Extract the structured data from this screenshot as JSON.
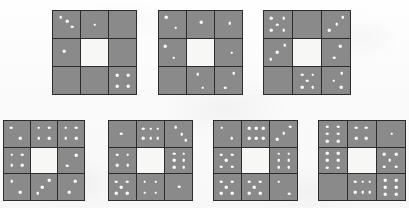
{
  "figure": {
    "title": "",
    "background_color": "#fcfcfc",
    "cell_color": "#8a8a8a",
    "center_cell_color": "#f7f7f5",
    "grid_line_color": "#2c2c2c",
    "dot_color": "#fdfdfd",
    "rows": [
      {
        "name": "top-row",
        "count": 3
      },
      {
        "name": "bottom-row",
        "count": 4
      }
    ]
  },
  "matrices": [
    {
      "id": "matrix-1",
      "row": "top-row",
      "index": 1,
      "x": 52,
      "y": 10,
      "width": 85,
      "height": 85,
      "cells": [
        {
          "name": "top-left",
          "dot_count": 3,
          "dots": [
            [
              28,
              22
            ],
            [
              52,
              38
            ],
            [
              72,
              58
            ]
          ]
        },
        {
          "name": "top-middle",
          "dot_count": 1,
          "dots": [
            [
              50,
              50
            ]
          ]
        },
        {
          "name": "top-right",
          "dot_count": 0,
          "dots": []
        },
        {
          "name": "middle-left",
          "dot_count": 1,
          "dots": [
            [
              42,
              46
            ]
          ]
        },
        {
          "name": "center",
          "dot_count": 0,
          "dots": [],
          "empty": true
        },
        {
          "name": "middle-right",
          "dot_count": 0,
          "dots": []
        },
        {
          "name": "bottom-left",
          "dot_count": 0,
          "dots": []
        },
        {
          "name": "bottom-middle",
          "dot_count": 0,
          "dots": []
        },
        {
          "name": "bottom-right",
          "dot_count": 4,
          "dots": [
            [
              30,
              30
            ],
            [
              72,
              30
            ],
            [
              30,
              72
            ],
            [
              72,
              72
            ]
          ]
        }
      ]
    },
    {
      "id": "matrix-2",
      "row": "top-row",
      "index": 2,
      "x": 158,
      "y": 10,
      "width": 85,
      "height": 85,
      "cells": [
        {
          "name": "top-left",
          "dot_count": 2,
          "dots": [
            [
              26,
              24
            ],
            [
              62,
              62
            ]
          ]
        },
        {
          "name": "top-middle",
          "dot_count": 1,
          "dots": [
            [
              52,
              42
            ]
          ]
        },
        {
          "name": "top-right",
          "dot_count": 1,
          "dots": [
            [
              54,
              46
            ]
          ]
        },
        {
          "name": "middle-left",
          "dot_count": 2,
          "dots": [
            [
              24,
              26
            ],
            [
              54,
              70
            ]
          ]
        },
        {
          "name": "center",
          "dot_count": 0,
          "dots": [],
          "empty": true
        },
        {
          "name": "middle-right",
          "dot_count": 1,
          "dots": [
            [
              62,
              50
            ]
          ]
        },
        {
          "name": "bottom-left",
          "dot_count": 0,
          "dots": []
        },
        {
          "name": "bottom-middle",
          "dot_count": 2,
          "dots": [
            [
              40,
              26
            ],
            [
              58,
              76
            ]
          ]
        },
        {
          "name": "bottom-right",
          "dot_count": 2,
          "dots": [
            [
              70,
              22
            ],
            [
              38,
              76
            ]
          ]
        }
      ]
    },
    {
      "id": "matrix-3",
      "row": "top-row",
      "index": 3,
      "x": 263,
      "y": 10,
      "width": 88,
      "height": 85,
      "cells": [
        {
          "name": "top-left",
          "dot_count": 5,
          "dots": [
            [
              26,
              26
            ],
            [
              70,
              26
            ],
            [
              48,
              50
            ],
            [
              26,
              72
            ],
            [
              70,
              72
            ]
          ]
        },
        {
          "name": "top-middle",
          "dot_count": 0,
          "dots": []
        },
        {
          "name": "top-right",
          "dot_count": 3,
          "dots": [
            [
              74,
              22
            ],
            [
              52,
              48
            ],
            [
              26,
              72
            ]
          ]
        },
        {
          "name": "middle-left",
          "dot_count": 3,
          "dots": [
            [
              74,
              22
            ],
            [
              48,
              48
            ],
            [
              24,
              74
            ]
          ]
        },
        {
          "name": "center",
          "dot_count": 0,
          "dots": [],
          "empty": true
        },
        {
          "name": "middle-right",
          "dot_count": 2,
          "dots": [
            [
              66,
              26
            ],
            [
              44,
              70
            ]
          ]
        },
        {
          "name": "bottom-left",
          "dot_count": 0,
          "dots": []
        },
        {
          "name": "bottom-middle",
          "dot_count": 5,
          "dots": [
            [
              32,
              28
            ],
            [
              70,
              28
            ],
            [
              50,
              50
            ],
            [
              32,
              74
            ],
            [
              70,
              74
            ]
          ]
        },
        {
          "name": "bottom-right",
          "dot_count": 3,
          "dots": [
            [
              70,
              24
            ],
            [
              42,
              50
            ],
            [
              68,
              74
            ]
          ]
        }
      ]
    },
    {
      "id": "matrix-4",
      "row": "bottom-row",
      "index": 4,
      "x": 3,
      "y": 120,
      "width": 82,
      "height": 81,
      "cells": [
        {
          "name": "top-left",
          "dot_count": 2,
          "dots": [
            [
              28,
              26
            ],
            [
              62,
              66
            ]
          ]
        },
        {
          "name": "top-middle",
          "dot_count": 4,
          "dots": [
            [
              30,
              26
            ],
            [
              70,
              26
            ],
            [
              30,
              66
            ],
            [
              70,
              66
            ]
          ]
        },
        {
          "name": "top-right",
          "dot_count": 4,
          "dots": [
            [
              30,
              26
            ],
            [
              70,
              26
            ],
            [
              30,
              66
            ],
            [
              70,
              66
            ]
          ]
        },
        {
          "name": "middle-left",
          "dot_count": 4,
          "dots": [
            [
              30,
              28
            ],
            [
              70,
              28
            ],
            [
              30,
              68
            ],
            [
              70,
              68
            ]
          ]
        },
        {
          "name": "center",
          "dot_count": 0,
          "dots": [],
          "empty": true
        },
        {
          "name": "middle-right",
          "dot_count": 2,
          "dots": [
            [
              70,
              30
            ],
            [
              36,
              70
            ]
          ]
        },
        {
          "name": "bottom-left",
          "dot_count": 2,
          "dots": [
            [
              30,
              26
            ],
            [
              62,
              70
            ]
          ]
        },
        {
          "name": "bottom-middle",
          "dot_count": 3,
          "dots": [
            [
              70,
              24
            ],
            [
              44,
              50
            ],
            [
              26,
              74
            ]
          ]
        },
        {
          "name": "bottom-right",
          "dot_count": 2,
          "dots": [
            [
              66,
              26
            ],
            [
              44,
              70
            ]
          ]
        }
      ]
    },
    {
      "id": "matrix-5",
      "row": "bottom-row",
      "index": 5,
      "x": 108,
      "y": 120,
      "width": 85,
      "height": 81,
      "cells": [
        {
          "name": "top-left",
          "dot_count": 1,
          "dots": [
            [
              46,
              50
            ]
          ]
        },
        {
          "name": "top-middle",
          "dot_count": 6,
          "dots": [
            [
              24,
              30
            ],
            [
              50,
              30
            ],
            [
              76,
              30
            ],
            [
              24,
              68
            ],
            [
              50,
              68
            ],
            [
              76,
              68
            ]
          ]
        },
        {
          "name": "top-right",
          "dot_count": 3,
          "dots": [
            [
              40,
              24
            ],
            [
              62,
              52
            ],
            [
              76,
              76
            ]
          ]
        },
        {
          "name": "middle-left",
          "dot_count": 4,
          "dots": [
            [
              30,
              28
            ],
            [
              70,
              28
            ],
            [
              30,
              68
            ],
            [
              70,
              68
            ]
          ]
        },
        {
          "name": "center",
          "dot_count": 0,
          "dots": [],
          "empty": true
        },
        {
          "name": "middle-right",
          "dot_count": 6,
          "dots": [
            [
              34,
              24
            ],
            [
              70,
              24
            ],
            [
              34,
              50
            ],
            [
              70,
              50
            ],
            [
              34,
              76
            ],
            [
              70,
              76
            ]
          ]
        },
        {
          "name": "bottom-left",
          "dot_count": 5,
          "dots": [
            [
              26,
              28
            ],
            [
              68,
              28
            ],
            [
              46,
              50
            ],
            [
              26,
              74
            ],
            [
              68,
              74
            ]
          ]
        },
        {
          "name": "bottom-middle",
          "dot_count": 4,
          "dots": [
            [
              28,
              28
            ],
            [
              70,
              28
            ],
            [
              28,
              72
            ],
            [
              70,
              72
            ]
          ]
        },
        {
          "name": "bottom-right",
          "dot_count": 1,
          "dots": [
            [
              52,
              48
            ]
          ]
        }
      ]
    },
    {
      "id": "matrix-6",
      "row": "bottom-row",
      "index": 6,
      "x": 213,
      "y": 120,
      "width": 85,
      "height": 81,
      "cells": [
        {
          "name": "top-left",
          "dot_count": 2,
          "dots": [
            [
              28,
              26
            ],
            [
              66,
              66
            ]
          ]
        },
        {
          "name": "top-middle",
          "dot_count": 6,
          "dots": [
            [
              26,
              28
            ],
            [
              52,
              28
            ],
            [
              78,
              28
            ],
            [
              26,
              66
            ],
            [
              52,
              66
            ],
            [
              78,
              66
            ]
          ]
        },
        {
          "name": "top-right",
          "dot_count": 3,
          "dots": [
            [
              74,
              22
            ],
            [
              50,
              48
            ],
            [
              26,
              72
            ]
          ]
        },
        {
          "name": "middle-left",
          "dot_count": 5,
          "dots": [
            [
              26,
              28
            ],
            [
              68,
              28
            ],
            [
              46,
              50
            ],
            [
              26,
              74
            ],
            [
              68,
              74
            ]
          ]
        },
        {
          "name": "center",
          "dot_count": 0,
          "dots": [],
          "empty": true
        },
        {
          "name": "middle-right",
          "dot_count": 6,
          "dots": [
            [
              32,
              24
            ],
            [
              70,
              24
            ],
            [
              32,
              50
            ],
            [
              70,
              50
            ],
            [
              32,
              76
            ],
            [
              70,
              76
            ]
          ]
        },
        {
          "name": "bottom-left",
          "dot_count": 5,
          "dots": [
            [
              26,
              28
            ],
            [
              68,
              28
            ],
            [
              46,
              50
            ],
            [
              26,
              74
            ],
            [
              68,
              74
            ]
          ]
        },
        {
          "name": "bottom-middle",
          "dot_count": 5,
          "dots": [
            [
              26,
              28
            ],
            [
              68,
              28
            ],
            [
              46,
              50
            ],
            [
              26,
              74
            ],
            [
              68,
              74
            ]
          ]
        },
        {
          "name": "bottom-right",
          "dot_count": 2,
          "dots": [
            [
              32,
              28
            ],
            [
              72,
              76
            ]
          ]
        }
      ]
    },
    {
      "id": "matrix-7",
      "row": "bottom-row",
      "index": 7,
      "x": 318,
      "y": 120,
      "width": 88,
      "height": 81,
      "cells": [
        {
          "name": "top-left",
          "dot_count": 6,
          "dots": [
            [
              30,
              22
            ],
            [
              68,
              22
            ],
            [
              30,
              50
            ],
            [
              68,
              50
            ],
            [
              30,
              78
            ],
            [
              68,
              78
            ]
          ]
        },
        {
          "name": "top-middle",
          "dot_count": 4,
          "dots": [
            [
              30,
              26
            ],
            [
              66,
              26
            ],
            [
              30,
              68
            ],
            [
              66,
              68
            ]
          ]
        },
        {
          "name": "top-right",
          "dot_count": 1,
          "dots": [
            [
              52,
              50
            ]
          ]
        },
        {
          "name": "middle-left",
          "dot_count": 6,
          "dots": [
            [
              30,
              22
            ],
            [
              68,
              22
            ],
            [
              30,
              50
            ],
            [
              68,
              50
            ],
            [
              30,
              78
            ],
            [
              68,
              78
            ]
          ]
        },
        {
          "name": "center",
          "dot_count": 0,
          "dots": [],
          "empty": true
        },
        {
          "name": "middle-right",
          "dot_count": 5,
          "dots": [
            [
              26,
              26
            ],
            [
              68,
              26
            ],
            [
              46,
              50
            ],
            [
              26,
              74
            ],
            [
              68,
              74
            ]
          ]
        },
        {
          "name": "bottom-left",
          "dot_count": 0,
          "dots": []
        },
        {
          "name": "bottom-middle",
          "dot_count": 6,
          "dots": [
            [
              26,
              28
            ],
            [
              52,
              28
            ],
            [
              78,
              28
            ],
            [
              26,
              70
            ],
            [
              52,
              70
            ],
            [
              78,
              70
            ]
          ]
        },
        {
          "name": "bottom-right",
          "dot_count": 6,
          "dots": [
            [
              30,
              22
            ],
            [
              68,
              22
            ],
            [
              30,
              50
            ],
            [
              68,
              50
            ],
            [
              30,
              78
            ],
            [
              68,
              78
            ]
          ]
        }
      ]
    }
  ]
}
